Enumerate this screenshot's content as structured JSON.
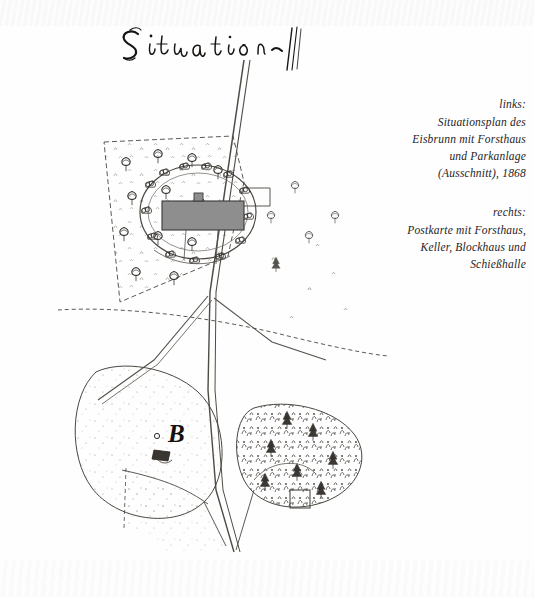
{
  "page": {
    "kind": "scanned-book-page",
    "background_color": "#fefefe",
    "ink_color": "#2b2724"
  },
  "map": {
    "title_text": "Situation",
    "title_style": "handwritten-script-with-flourish",
    "building_label": "B",
    "building_fill_color": "#8e8e8e",
    "description": "Situationsplan Eisbrunn 1868 — forester's house with park, roads, meadow and woodland"
  },
  "captions": [
    {
      "lead": "links:",
      "lines": [
        "Situationsplan des",
        "Eisbrunn mit Forsthaus",
        "und Parkanlage",
        "(Ausschnitt), 1868"
      ]
    },
    {
      "lead": "rechts:",
      "lines": [
        "Postkarte mit Forsthaus,",
        "Keller, Blockhaus und",
        "Schießhalle"
      ]
    }
  ]
}
